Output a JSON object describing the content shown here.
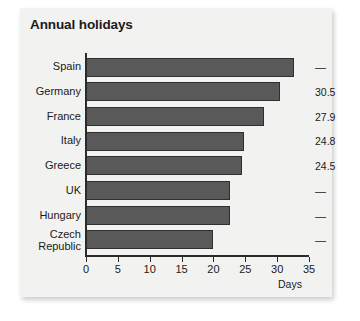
{
  "card": {
    "title": "Annual holidays"
  },
  "chart_data": {
    "type": "bar",
    "orientation": "horizontal",
    "title": "Annual holidays",
    "xlabel": "Days",
    "ylabel": "",
    "xlim": [
      0,
      35
    ],
    "xticks": [
      0,
      5,
      10,
      15,
      20,
      25,
      30,
      35
    ],
    "xtick_labels": [
      "0",
      "5",
      "10",
      "15",
      "20",
      "25",
      "30",
      "35"
    ],
    "grid": false,
    "legend": false,
    "categories": [
      "Spain",
      "Germany",
      "France",
      "Italy",
      "Greece",
      "UK",
      "Hungary",
      "Czech Republic"
    ],
    "values": [
      32.7,
      30.5,
      27.9,
      24.8,
      24.5,
      22.6,
      22.6,
      19.9
    ],
    "data_labels": [
      "—",
      "30.5",
      "27.9",
      "24.8",
      "24.5",
      "—",
      "—",
      "—"
    ],
    "bar_color": "#595959",
    "bar_edge_color": "#2f2f2f",
    "background_color": "#f2f2f0"
  },
  "rows": [
    {
      "label": "Spain",
      "label_line1": "Spain",
      "label_line2": "",
      "value": 32.7,
      "data_label": "—",
      "labeled": false
    },
    {
      "label": "Germany",
      "label_line1": "Germany",
      "label_line2": "",
      "value": 30.5,
      "data_label": "30.5",
      "labeled": true
    },
    {
      "label": "France",
      "label_line1": "France",
      "label_line2": "",
      "value": 27.9,
      "data_label": "27.9",
      "labeled": true
    },
    {
      "label": "Italy",
      "label_line1": "Italy",
      "label_line2": "",
      "value": 24.8,
      "data_label": "24.8",
      "labeled": true
    },
    {
      "label": "Greece",
      "label_line1": "Greece",
      "label_line2": "",
      "value": 24.5,
      "data_label": "24.5",
      "labeled": true
    },
    {
      "label": "UK",
      "label_line1": "UK",
      "label_line2": "",
      "value": 22.6,
      "data_label": "—",
      "labeled": false
    },
    {
      "label": "Hungary",
      "label_line1": "Hungary",
      "label_line2": "",
      "value": 22.6,
      "data_label": "—",
      "labeled": false
    },
    {
      "label": "Czech Republic",
      "label_line1": "Czech",
      "label_line2": "Republic",
      "value": 19.9,
      "data_label": "—",
      "labeled": false
    }
  ],
  "axis": {
    "title": "Days",
    "ticks": [
      "0",
      "5",
      "10",
      "15",
      "20",
      "25",
      "30",
      "35"
    ]
  }
}
